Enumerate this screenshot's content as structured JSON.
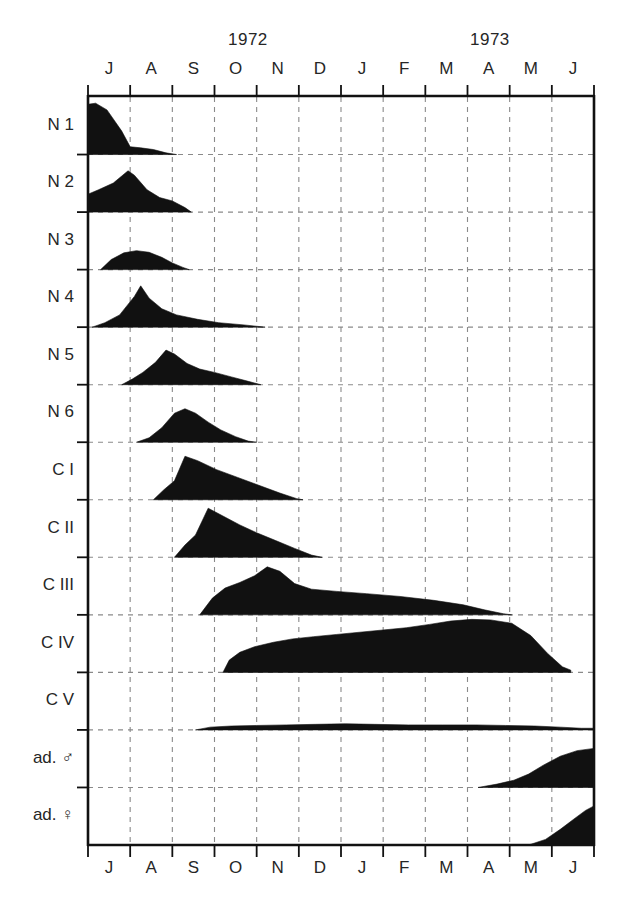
{
  "axis": {
    "years": [
      {
        "label": "1972",
        "x": 228
      },
      {
        "label": "1973",
        "x": 470
      }
    ],
    "months": [
      "J",
      "A",
      "S",
      "O",
      "N",
      "D",
      "J",
      "F",
      "M",
      "A",
      "M",
      "J"
    ],
    "month_count": 12,
    "plot": {
      "left": 88,
      "right": 594,
      "top": 97,
      "bottom": 845
    },
    "colors": {
      "ink": "#111111",
      "grid": "#8a8a8a",
      "frame": "#111111",
      "background": "#ffffff"
    }
  },
  "stages": [
    {
      "id": "n1",
      "label": "N 1",
      "symbol": ""
    },
    {
      "id": "n2",
      "label": "N 2",
      "symbol": ""
    },
    {
      "id": "n3",
      "label": "N 3",
      "symbol": ""
    },
    {
      "id": "n4",
      "label": "N 4",
      "symbol": ""
    },
    {
      "id": "n5",
      "label": "N 5",
      "symbol": ""
    },
    {
      "id": "n6",
      "label": "N 6",
      "symbol": ""
    },
    {
      "id": "c1",
      "label": "C I",
      "symbol": ""
    },
    {
      "id": "c2",
      "label": "C II",
      "symbol": ""
    },
    {
      "id": "c3",
      "label": "C III",
      "symbol": ""
    },
    {
      "id": "c4",
      "label": "C IV",
      "symbol": ""
    },
    {
      "id": "c5",
      "label": "C V",
      "symbol": ""
    },
    {
      "id": "adm",
      "label": "ad. ♂",
      "symbol": "male"
    },
    {
      "id": "adf",
      "label": "ad. ♀",
      "symbol": "female"
    }
  ],
  "chart_data": {
    "type": "area",
    "title": "",
    "xlabel": "",
    "ylabel": "",
    "x_axis": {
      "tick_labels": [
        "J",
        "A",
        "S",
        "O",
        "N",
        "D",
        "J",
        "F",
        "M",
        "A",
        "M",
        "J"
      ],
      "month_index": {
        "J1": 0,
        "A1": 1,
        "S": 2,
        "O": 3,
        "N": 4,
        "D": 5,
        "J2": 6,
        "F": 7,
        "M1": 8,
        "A2": 9,
        "M2": 10,
        "J3": 11
      },
      "range": [
        0,
        12
      ],
      "year_spans": [
        {
          "year": "1972",
          "from": 0,
          "to": 6
        },
        {
          "year": "1973",
          "from": 6,
          "to": 12
        }
      ]
    },
    "y_axis": {
      "categories": [
        "N 1",
        "N 2",
        "N 3",
        "N 4",
        "N 5",
        "N 6",
        "C I",
        "C II",
        "C III",
        "C IV",
        "C V",
        "ad. ♂",
        "ad. ♀"
      ],
      "row_count": 13,
      "value_range": [
        0,
        1
      ]
    },
    "grid": true,
    "legend_position": "none",
    "series": [
      {
        "name": "N 1",
        "points": [
          [
            0.0,
            0.9
          ],
          [
            0.18,
            0.92
          ],
          [
            0.45,
            0.8
          ],
          [
            0.8,
            0.42
          ],
          [
            1.0,
            0.14
          ],
          [
            1.25,
            0.12
          ],
          [
            1.55,
            0.09
          ],
          [
            1.85,
            0.03
          ],
          [
            2.1,
            0.0
          ]
        ]
      },
      {
        "name": "N 2",
        "points": [
          [
            0.0,
            0.32
          ],
          [
            0.25,
            0.4
          ],
          [
            0.6,
            0.52
          ],
          [
            0.95,
            0.74
          ],
          [
            1.1,
            0.66
          ],
          [
            1.4,
            0.4
          ],
          [
            1.7,
            0.26
          ],
          [
            2.0,
            0.2
          ],
          [
            2.3,
            0.08
          ],
          [
            2.45,
            0.0
          ]
        ]
      },
      {
        "name": "N 3",
        "points": [
          [
            0.3,
            0.0
          ],
          [
            0.55,
            0.18
          ],
          [
            0.85,
            0.3
          ],
          [
            1.15,
            0.34
          ],
          [
            1.45,
            0.31
          ],
          [
            1.75,
            0.22
          ],
          [
            2.0,
            0.12
          ],
          [
            2.25,
            0.04
          ],
          [
            2.4,
            0.0
          ]
        ]
      },
      {
        "name": "N 4",
        "points": [
          [
            0.1,
            0.0
          ],
          [
            0.4,
            0.08
          ],
          [
            0.75,
            0.22
          ],
          [
            1.1,
            0.55
          ],
          [
            1.25,
            0.74
          ],
          [
            1.45,
            0.52
          ],
          [
            1.75,
            0.33
          ],
          [
            2.1,
            0.22
          ],
          [
            2.6,
            0.14
          ],
          [
            3.1,
            0.08
          ],
          [
            3.7,
            0.04
          ],
          [
            4.2,
            0.0
          ]
        ]
      },
      {
        "name": "N 5",
        "points": [
          [
            0.8,
            0.0
          ],
          [
            1.05,
            0.1
          ],
          [
            1.3,
            0.22
          ],
          [
            1.6,
            0.4
          ],
          [
            1.85,
            0.62
          ],
          [
            2.05,
            0.55
          ],
          [
            2.35,
            0.38
          ],
          [
            2.65,
            0.28
          ],
          [
            3.0,
            0.22
          ],
          [
            3.4,
            0.14
          ],
          [
            3.8,
            0.06
          ],
          [
            4.1,
            0.0
          ]
        ]
      },
      {
        "name": "N 6",
        "points": [
          [
            1.15,
            0.0
          ],
          [
            1.45,
            0.08
          ],
          [
            1.75,
            0.26
          ],
          [
            2.05,
            0.52
          ],
          [
            2.3,
            0.6
          ],
          [
            2.55,
            0.52
          ],
          [
            2.85,
            0.36
          ],
          [
            3.15,
            0.22
          ],
          [
            3.5,
            0.1
          ],
          [
            3.8,
            0.02
          ],
          [
            4.0,
            0.0
          ]
        ]
      },
      {
        "name": "C I",
        "points": [
          [
            1.55,
            0.0
          ],
          [
            1.8,
            0.18
          ],
          [
            2.05,
            0.34
          ],
          [
            2.3,
            0.78
          ],
          [
            2.6,
            0.7
          ],
          [
            3.05,
            0.54
          ],
          [
            3.55,
            0.4
          ],
          [
            4.05,
            0.26
          ],
          [
            4.55,
            0.12
          ],
          [
            4.95,
            0.02
          ],
          [
            5.1,
            0.0
          ]
        ]
      },
      {
        "name": "C II",
        "points": [
          [
            2.05,
            0.0
          ],
          [
            2.3,
            0.22
          ],
          [
            2.55,
            0.4
          ],
          [
            2.85,
            0.88
          ],
          [
            3.2,
            0.74
          ],
          [
            3.6,
            0.58
          ],
          [
            4.0,
            0.44
          ],
          [
            4.45,
            0.3
          ],
          [
            4.9,
            0.16
          ],
          [
            5.3,
            0.04
          ],
          [
            5.55,
            0.0
          ]
        ]
      },
      {
        "name": "C III",
        "points": [
          [
            2.65,
            0.0
          ],
          [
            2.95,
            0.3
          ],
          [
            3.25,
            0.48
          ],
          [
            3.6,
            0.58
          ],
          [
            3.95,
            0.7
          ],
          [
            4.25,
            0.86
          ],
          [
            4.55,
            0.78
          ],
          [
            4.9,
            0.56
          ],
          [
            5.3,
            0.46
          ],
          [
            5.9,
            0.42
          ],
          [
            6.6,
            0.38
          ],
          [
            7.4,
            0.33
          ],
          [
            8.2,
            0.26
          ],
          [
            8.9,
            0.18
          ],
          [
            9.4,
            0.09
          ],
          [
            9.85,
            0.02
          ],
          [
            10.05,
            0.0
          ]
        ]
      },
      {
        "name": "C IV",
        "points": [
          [
            3.2,
            0.0
          ],
          [
            3.35,
            0.22
          ],
          [
            3.6,
            0.36
          ],
          [
            3.95,
            0.46
          ],
          [
            4.4,
            0.54
          ],
          [
            4.85,
            0.6
          ],
          [
            5.35,
            0.64
          ],
          [
            5.9,
            0.68
          ],
          [
            6.45,
            0.72
          ],
          [
            7.0,
            0.76
          ],
          [
            7.55,
            0.8
          ],
          [
            8.1,
            0.86
          ],
          [
            8.6,
            0.92
          ],
          [
            9.1,
            0.95
          ],
          [
            9.55,
            0.94
          ],
          [
            10.05,
            0.88
          ],
          [
            10.5,
            0.66
          ],
          [
            10.9,
            0.34
          ],
          [
            11.25,
            0.1
          ],
          [
            11.45,
            0.04
          ]
        ]
      },
      {
        "name": "C V",
        "points": [
          [
            2.55,
            0.0
          ],
          [
            2.9,
            0.05
          ],
          [
            3.4,
            0.07
          ],
          [
            4.0,
            0.08
          ],
          [
            4.7,
            0.09
          ],
          [
            5.4,
            0.1
          ],
          [
            6.1,
            0.11
          ],
          [
            6.8,
            0.1
          ],
          [
            7.6,
            0.09
          ],
          [
            8.4,
            0.09
          ],
          [
            9.2,
            0.09
          ],
          [
            9.9,
            0.08
          ],
          [
            10.6,
            0.07
          ],
          [
            11.2,
            0.05
          ],
          [
            11.7,
            0.03
          ],
          [
            12.0,
            0.03
          ]
        ]
      },
      {
        "name": "ad. ♂",
        "points": [
          [
            9.25,
            0.0
          ],
          [
            9.7,
            0.06
          ],
          [
            10.1,
            0.13
          ],
          [
            10.45,
            0.24
          ],
          [
            10.8,
            0.4
          ],
          [
            11.2,
            0.56
          ],
          [
            11.6,
            0.66
          ],
          [
            12.0,
            0.7
          ]
        ]
      },
      {
        "name": "ad. ♀",
        "points": [
          [
            10.45,
            0.0
          ],
          [
            10.85,
            0.1
          ],
          [
            11.2,
            0.28
          ],
          [
            11.55,
            0.48
          ],
          [
            11.8,
            0.62
          ],
          [
            12.0,
            0.7
          ]
        ]
      }
    ]
  }
}
